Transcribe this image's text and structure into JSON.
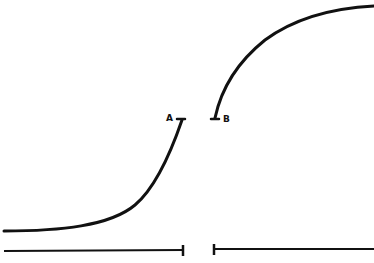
{
  "diagram": {
    "stroke_color": "#111111",
    "background": "#ffffff",
    "labels": {
      "point_a": "A",
      "point_b": "B"
    },
    "curves": [
      {
        "id": "lower-curve",
        "description": "rising curve ending at A"
      },
      {
        "id": "upper-curve",
        "description": "saturating curve starting at B"
      }
    ],
    "baselines": [
      {
        "id": "baseline-left",
        "from_x": 4,
        "to_x": 183
      },
      {
        "id": "baseline-right",
        "from_x": 214,
        "to_x": 374
      }
    ]
  }
}
